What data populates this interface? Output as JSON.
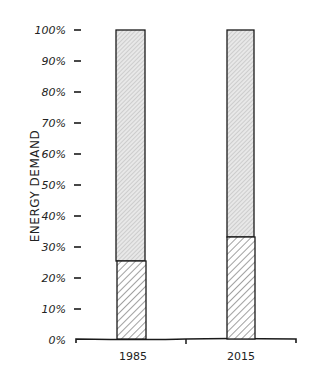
{
  "chart_data": {
    "type": "bar",
    "stacked": true,
    "title": "",
    "xlabel": "",
    "ylabel": "ENERGY DEMAND",
    "categories": [
      "1985",
      "2015"
    ],
    "series": [
      {
        "name": "lower segment (dense hatch)",
        "values": [
          25,
          33
        ]
      },
      {
        "name": "upper segment (light hatch)",
        "values": [
          75,
          67
        ]
      }
    ],
    "ylim": [
      0,
      100
    ],
    "yticks": [
      "0%",
      "10%",
      "20%",
      "30%",
      "40%",
      "50%",
      "60%",
      "70%",
      "80%",
      "90%",
      "100%"
    ],
    "grid": false,
    "legend": null,
    "style": "hand-drawn xkcd"
  },
  "labels": {
    "ylabel": "ENERGY DEMAND",
    "cat0": "1985",
    "cat1": "2015",
    "ticks": [
      "0%",
      "10%",
      "20%",
      "30%",
      "40%",
      "50%",
      "60%",
      "70%",
      "80%",
      "90%",
      "100%"
    ]
  },
  "colors": {
    "ink": "#1a1a1a",
    "upper_fill": "#e6e6e6",
    "lower_fill": "#ffffff",
    "hatch": "#555555"
  }
}
